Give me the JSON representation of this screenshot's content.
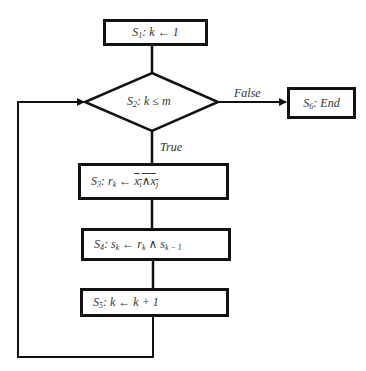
{
  "flowchart": {
    "nodes": [
      {
        "id": "S1",
        "type": "process",
        "label": "S1: k ← 1"
      },
      {
        "id": "S2",
        "type": "decision",
        "label": "S2: k ≤ m"
      },
      {
        "id": "S3",
        "type": "process",
        "label": "S3: rk ← ¬(xi ∧ xj)"
      },
      {
        "id": "S4",
        "type": "process",
        "label": "S4: sk ← rk ∧ sk−1"
      },
      {
        "id": "S5",
        "type": "process",
        "label": "S5: k ← k + 1"
      },
      {
        "id": "S6",
        "type": "terminal",
        "label": "S6: End"
      }
    ],
    "edges": [
      {
        "from": "S1",
        "to": "S2",
        "label": ""
      },
      {
        "from": "S2",
        "to": "S6",
        "label": "False"
      },
      {
        "from": "S2",
        "to": "S3",
        "label": "True"
      },
      {
        "from": "S3",
        "to": "S4",
        "label": ""
      },
      {
        "from": "S4",
        "to": "S5",
        "label": ""
      },
      {
        "from": "S5",
        "to": "S2",
        "label": ""
      }
    ]
  },
  "text": {
    "s1_prefix": "S",
    "s1_sub": "1",
    "s1_body": ": k ← 1",
    "s2_prefix": "S",
    "s2_sub": "2",
    "s2_body": ": k ≤ m",
    "s3_prefix": "S",
    "s3_sub": "3",
    "s3_body": ": r",
    "s3_rsub": "k",
    "s3_arrow": " ← ",
    "s3_x1": "x",
    "s3_x1sub": "i",
    "s3_and": "∧",
    "s3_x2": "x",
    "s3_x2sub": "j",
    "s4_prefix": "S",
    "s4_sub": "4",
    "s4_body1": ": s",
    "s4_ssub": "k",
    "s4_body2": " ← r",
    "s4_rsub": "k",
    "s4_body3": " ∧ s",
    "s4_s2sub": "k − 1",
    "s5_prefix": "S",
    "s5_sub": "5",
    "s5_body": ": k ← k + 1",
    "s6_prefix": "S",
    "s6_sub": "6",
    "s6_body": ": End",
    "false_label": "False",
    "true_label": "True"
  },
  "colors": {
    "stroke": "#111111",
    "text": "#333333",
    "background": "#ffffff"
  }
}
